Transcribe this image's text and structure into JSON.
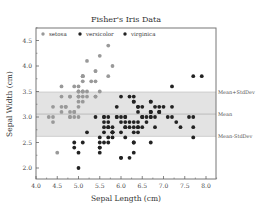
{
  "chart_data": {
    "type": "scatter",
    "title": "Fisher's Iris Data",
    "xlabel": "Sepal Length (cm)",
    "ylabel": "Sepal Width (cm)",
    "xlim": [
      4.0,
      8.25
    ],
    "ylim": [
      1.78,
      4.74
    ],
    "xticks": [
      "4.0",
      "4.5",
      "5.0",
      "5.5",
      "6.0",
      "6.5",
      "7.0",
      "7.5",
      "8.0"
    ],
    "yticks": [
      "2.0",
      "2.5",
      "3.0",
      "3.5",
      "4.0",
      "4.5"
    ],
    "grid": false,
    "legend_position": "top-left inside",
    "band": {
      "mean": 3.057,
      "upper": 3.49,
      "lower": 2.62,
      "labels": {
        "upper": "Mean+StdDev",
        "mean": "Mean",
        "lower": "Mean-StdDev"
      }
    },
    "series": [
      {
        "name": "setosa",
        "color": "#999999",
        "points": [
          [
            5.1,
            3.5
          ],
          [
            4.9,
            3.0
          ],
          [
            4.7,
            3.2
          ],
          [
            4.6,
            3.1
          ],
          [
            5.0,
            3.6
          ],
          [
            5.4,
            3.9
          ],
          [
            4.6,
            3.4
          ],
          [
            5.0,
            3.4
          ],
          [
            4.4,
            2.9
          ],
          [
            4.9,
            3.1
          ],
          [
            5.4,
            3.7
          ],
          [
            4.8,
            3.4
          ],
          [
            4.8,
            3.0
          ],
          [
            4.3,
            3.0
          ],
          [
            5.8,
            4.0
          ],
          [
            5.7,
            4.4
          ],
          [
            5.4,
            3.9
          ],
          [
            5.1,
            3.5
          ],
          [
            5.7,
            3.8
          ],
          [
            5.1,
            3.8
          ],
          [
            5.4,
            3.4
          ],
          [
            5.1,
            3.7
          ],
          [
            4.6,
            3.6
          ],
          [
            5.1,
            3.3
          ],
          [
            4.8,
            3.4
          ],
          [
            5.0,
            3.0
          ],
          [
            5.0,
            3.4
          ],
          [
            5.2,
            3.5
          ],
          [
            5.2,
            3.4
          ],
          [
            4.7,
            3.2
          ],
          [
            4.8,
            3.1
          ],
          [
            5.4,
            3.4
          ],
          [
            5.2,
            4.1
          ],
          [
            5.5,
            4.2
          ],
          [
            4.9,
            3.1
          ],
          [
            5.0,
            3.2
          ],
          [
            5.5,
            3.5
          ],
          [
            4.9,
            3.6
          ],
          [
            4.4,
            3.0
          ],
          [
            5.1,
            3.4
          ],
          [
            5.0,
            3.5
          ],
          [
            4.5,
            2.3
          ],
          [
            4.4,
            3.2
          ],
          [
            5.0,
            3.5
          ],
          [
            5.1,
            3.8
          ],
          [
            4.8,
            3.0
          ],
          [
            5.1,
            3.8
          ],
          [
            4.6,
            3.2
          ],
          [
            5.3,
            3.7
          ],
          [
            5.0,
            3.3
          ]
        ]
      },
      {
        "name": "versicolor",
        "color": "#222222",
        "points": [
          [
            7.0,
            3.2
          ],
          [
            6.4,
            3.2
          ],
          [
            6.9,
            3.1
          ],
          [
            5.5,
            2.3
          ],
          [
            6.5,
            2.8
          ],
          [
            5.7,
            2.8
          ],
          [
            6.3,
            3.3
          ],
          [
            4.9,
            2.4
          ],
          [
            6.6,
            2.9
          ],
          [
            5.2,
            2.7
          ],
          [
            5.0,
            2.0
          ],
          [
            5.9,
            3.0
          ],
          [
            6.0,
            2.2
          ],
          [
            6.1,
            2.9
          ],
          [
            5.6,
            2.9
          ],
          [
            6.7,
            3.1
          ],
          [
            5.6,
            3.0
          ],
          [
            5.8,
            2.7
          ],
          [
            6.2,
            2.2
          ],
          [
            5.6,
            2.5
          ],
          [
            5.9,
            3.2
          ],
          [
            6.1,
            2.8
          ],
          [
            6.3,
            2.5
          ],
          [
            6.1,
            2.8
          ],
          [
            6.4,
            2.9
          ],
          [
            6.6,
            3.0
          ],
          [
            6.8,
            2.8
          ],
          [
            6.7,
            3.0
          ],
          [
            6.0,
            2.9
          ],
          [
            5.7,
            2.6
          ],
          [
            5.5,
            2.4
          ],
          [
            5.5,
            2.4
          ],
          [
            5.8,
            2.7
          ],
          [
            6.0,
            2.7
          ],
          [
            5.4,
            3.0
          ],
          [
            6.0,
            3.4
          ],
          [
            6.7,
            3.1
          ],
          [
            6.3,
            2.3
          ],
          [
            5.6,
            3.0
          ],
          [
            5.5,
            2.5
          ],
          [
            5.5,
            2.6
          ],
          [
            6.1,
            3.0
          ],
          [
            5.8,
            2.6
          ],
          [
            5.0,
            2.3
          ],
          [
            5.6,
            2.7
          ],
          [
            5.7,
            3.0
          ],
          [
            5.7,
            2.9
          ],
          [
            6.2,
            2.9
          ],
          [
            5.1,
            2.5
          ],
          [
            5.7,
            2.8
          ]
        ]
      },
      {
        "name": "virginica",
        "color": "#222222",
        "points": [
          [
            6.3,
            3.3
          ],
          [
            5.8,
            2.7
          ],
          [
            7.1,
            3.0
          ],
          [
            6.3,
            2.9
          ],
          [
            6.5,
            3.0
          ],
          [
            7.6,
            3.0
          ],
          [
            4.9,
            2.5
          ],
          [
            7.3,
            2.9
          ],
          [
            6.7,
            2.5
          ],
          [
            7.2,
            3.6
          ],
          [
            6.5,
            3.2
          ],
          [
            6.4,
            2.7
          ],
          [
            6.8,
            3.0
          ],
          [
            5.7,
            2.5
          ],
          [
            5.8,
            2.8
          ],
          [
            6.4,
            3.2
          ],
          [
            6.5,
            3.0
          ],
          [
            7.7,
            3.8
          ],
          [
            7.7,
            2.6
          ],
          [
            6.0,
            2.2
          ],
          [
            6.9,
            3.2
          ],
          [
            5.6,
            2.8
          ],
          [
            7.7,
            2.8
          ],
          [
            6.3,
            2.7
          ],
          [
            6.7,
            3.3
          ],
          [
            7.2,
            3.2
          ],
          [
            6.2,
            2.8
          ],
          [
            6.1,
            3.0
          ],
          [
            6.4,
            2.8
          ],
          [
            7.2,
            3.0
          ],
          [
            7.4,
            2.8
          ],
          [
            7.9,
            3.8
          ],
          [
            6.4,
            2.8
          ],
          [
            6.3,
            2.8
          ],
          [
            6.1,
            2.6
          ],
          [
            7.7,
            3.0
          ],
          [
            6.3,
            3.4
          ],
          [
            6.4,
            3.1
          ],
          [
            6.0,
            3.0
          ],
          [
            6.9,
            3.1
          ],
          [
            6.7,
            3.1
          ],
          [
            6.9,
            3.1
          ],
          [
            5.8,
            2.7
          ],
          [
            6.8,
            3.2
          ],
          [
            6.7,
            3.3
          ],
          [
            6.7,
            3.0
          ],
          [
            6.3,
            2.5
          ],
          [
            6.5,
            3.0
          ],
          [
            6.2,
            3.4
          ],
          [
            5.9,
            3.0
          ]
        ]
      }
    ]
  }
}
